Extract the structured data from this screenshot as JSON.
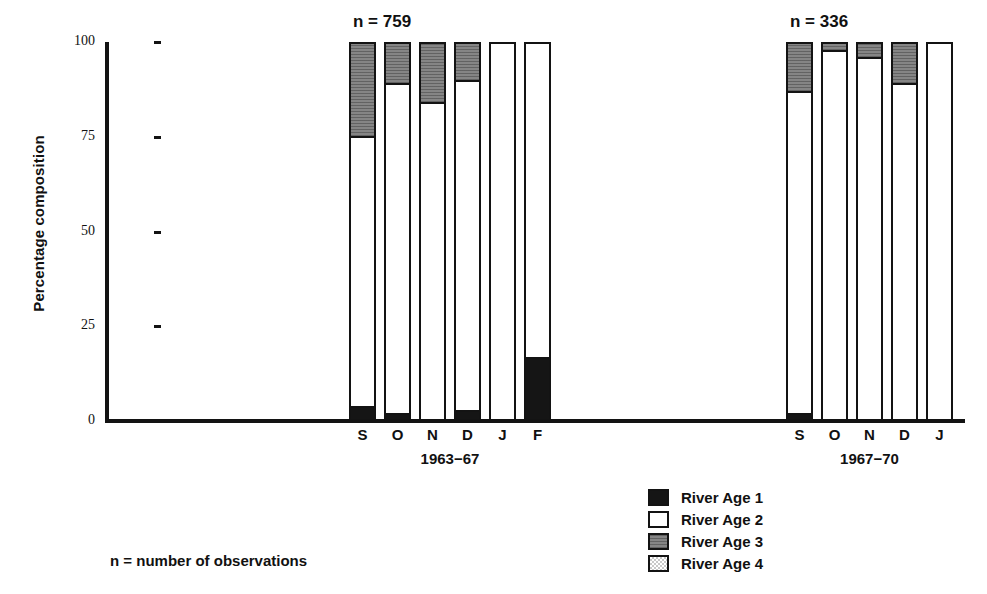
{
  "axis": {
    "y_title": "Percentage composition",
    "y_ticks": [
      "100",
      "75",
      "50",
      "25",
      "0"
    ]
  },
  "groups": [
    {
      "id": "group-1963-67",
      "title": "1963−67",
      "n_label": "n = 759",
      "months": [
        "S",
        "O",
        "N",
        "D",
        "J",
        "F"
      ]
    },
    {
      "id": "group-1967-70",
      "title": "1967−70",
      "n_label": "n = 336",
      "months": [
        "S",
        "O",
        "N",
        "D",
        "J"
      ]
    }
  ],
  "legend": {
    "items": [
      {
        "label": "River Age 1",
        "swatch": "black-solid",
        "color": "#151515"
      },
      {
        "label": "River Age 2",
        "swatch": "white-solid",
        "color": "#ffffff"
      },
      {
        "label": "River Age 3",
        "swatch": "dark-gray-hatched",
        "color": "#8d8d8d"
      },
      {
        "label": "River Age 4",
        "swatch": "light-gray-dotted",
        "color": "#c9c9c9"
      }
    ]
  },
  "footnote": "n = number of observations",
  "chart_data": {
    "type": "bar",
    "subtype": "stacked-percentage",
    "title": "",
    "xlabel": "",
    "ylabel": "Percentage composition",
    "ylim": [
      0,
      100
    ],
    "yticks": [
      0,
      25,
      50,
      75,
      100
    ],
    "grid": false,
    "legend_position": "bottom-right",
    "series": [
      {
        "name": "River Age 1",
        "color": "#151515"
      },
      {
        "name": "River Age 2",
        "color": "#ffffff"
      },
      {
        "name": "River Age 3",
        "color": "#8d8d8d"
      },
      {
        "name": "River Age 4",
        "color": "#c9c9c9"
      }
    ],
    "groups": [
      {
        "name": "1963−67",
        "n": 759,
        "categories": [
          "S",
          "O",
          "N",
          "D",
          "J",
          "F"
        ],
        "values": {
          "River Age 1": [
            3,
            1,
            0,
            2,
            0,
            16
          ],
          "River Age 2": [
            72,
            88,
            84,
            88,
            100,
            84
          ],
          "River Age 3": [
            25,
            11,
            16,
            10,
            0,
            0
          ],
          "River Age 4": [
            0,
            0,
            0,
            0,
            0,
            0
          ]
        }
      },
      {
        "name": "1967−70",
        "n": 336,
        "categories": [
          "S",
          "O",
          "N",
          "D",
          "J"
        ],
        "values": {
          "River Age 1": [
            1,
            0,
            0,
            0,
            0
          ],
          "River Age 2": [
            86,
            98,
            96,
            89,
            100
          ],
          "River Age 3": [
            13,
            2,
            4,
            11,
            0
          ],
          "River Age 4": [
            0,
            0,
            0,
            0,
            0
          ]
        }
      }
    ]
  }
}
